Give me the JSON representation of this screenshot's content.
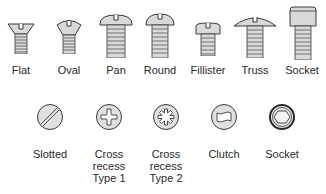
{
  "head_types": {
    "items": [
      {
        "label": "Flat",
        "icon": "flat-head-screw-icon"
      },
      {
        "label": "Oval",
        "icon": "oval-head-screw-icon"
      },
      {
        "label": "Pan",
        "icon": "pan-head-screw-icon"
      },
      {
        "label": "Round",
        "icon": "round-head-screw-icon"
      },
      {
        "label": "Fillister",
        "icon": "fillister-head-screw-icon"
      },
      {
        "label": "Truss",
        "icon": "truss-head-screw-icon"
      },
      {
        "label": "Socket",
        "icon": "socket-head-screw-icon"
      }
    ]
  },
  "drive_types": {
    "items": [
      {
        "label": "Slotted",
        "icon": "slotted-drive-icon"
      },
      {
        "label_lines": [
          "Cross",
          "recess",
          "Type 1"
        ],
        "icon": "cross-recess-type1-icon"
      },
      {
        "label_lines": [
          "Cross",
          "recess",
          "Type 2"
        ],
        "icon": "cross-recess-type2-icon"
      },
      {
        "label": "Clutch",
        "icon": "clutch-drive-icon"
      },
      {
        "label": "Socket",
        "icon": "socket-drive-icon"
      }
    ]
  },
  "colors": {
    "fill": "#d9d9d9",
    "stroke": "#3a3a3a",
    "background": "#ffffff"
  }
}
